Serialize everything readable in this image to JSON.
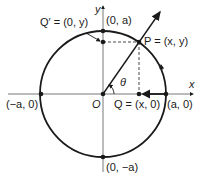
{
  "diagram": {
    "labels": {
      "y_axis": "y",
      "x_axis": "x",
      "top": "(0, a)",
      "bottom": "(0, −a)",
      "left": "(−a, 0)",
      "right": "(a, 0)",
      "origin": "O",
      "q_prime": "Q′ = (0, y)",
      "p": "P = (x, y)",
      "q": "Q = (x, 0)",
      "theta": "θ"
    },
    "colors": {
      "stroke": "#1a1a1a",
      "axis": "#555555",
      "background": "#ffffff"
    }
  }
}
